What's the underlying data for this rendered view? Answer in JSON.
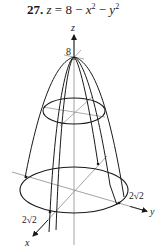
{
  "problem": {
    "number": "27.",
    "equation_lhs": "z",
    "equation_eq": " = 8 − ",
    "var_x": "x",
    "exp_x": "2",
    "minus": " − ",
    "var_y": "y",
    "exp_y": "2"
  },
  "figure": {
    "axes": {
      "z_label": "z",
      "y_label": "y",
      "x_label": "x"
    },
    "annotations": {
      "apex_value": "8",
      "radius_y": "2√2",
      "radius_x": "2√2"
    },
    "colors": {
      "stroke": "#1a1a1a",
      "axis": "#8a8a8a",
      "background": "#ffffff"
    }
  }
}
